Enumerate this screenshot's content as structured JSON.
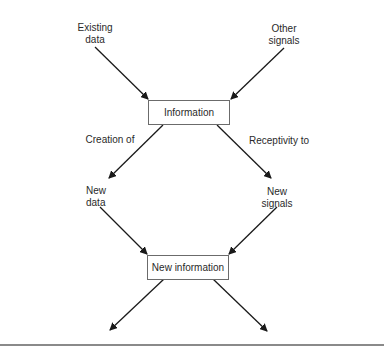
{
  "diagram": {
    "nodes": {
      "existing_data": {
        "line1": "Existing",
        "line2": "data"
      },
      "other_signals": {
        "line1": "Other",
        "line2": "signals"
      },
      "information": "Information",
      "creation_of": "Creation of",
      "receptivity_to": "Receptivity to",
      "new_data": {
        "line1": "New",
        "line2": "data"
      },
      "new_signals": {
        "line1": "New",
        "line2": "signals"
      },
      "new_information": "New information"
    },
    "edges": [
      {
        "from": "Existing data",
        "to": "Information"
      },
      {
        "from": "Other signals",
        "to": "Information"
      },
      {
        "from": "Information",
        "to": "New data",
        "label": "Creation of"
      },
      {
        "from": "Information",
        "to": "New signals",
        "label": "Receptivity to"
      },
      {
        "from": "New data",
        "to": "New information"
      },
      {
        "from": "New signals",
        "to": "New information"
      },
      {
        "from": "New information",
        "to": "(continues left)"
      },
      {
        "from": "New information",
        "to": "(continues right)"
      }
    ],
    "colors": {
      "line": "#1a1a1a",
      "box_border": "#6b6b6b",
      "rule": "#8a8a8a"
    }
  }
}
